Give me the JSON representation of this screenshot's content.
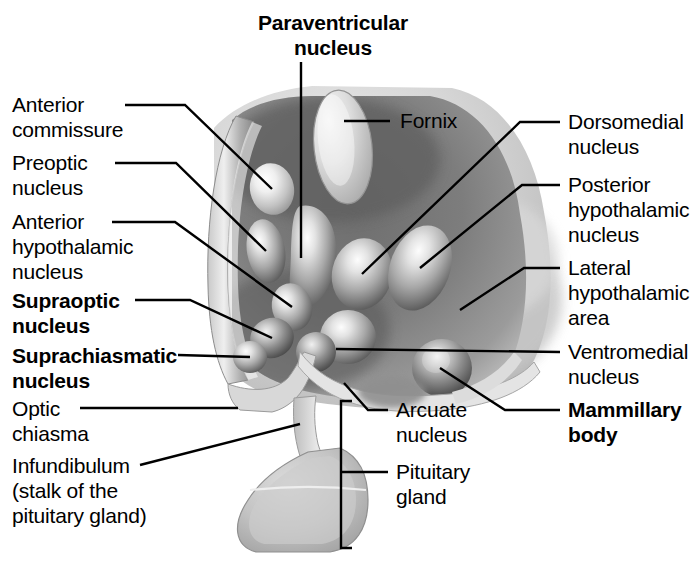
{
  "figure": {
    "background_color": "#ffffff",
    "line_color": "#000000",
    "text_color": "#000000"
  },
  "labels": {
    "paraventricular_nucleus": "Paraventricular\nnucleus",
    "anterior_commissure": "Anterior\ncommissure",
    "preoptic_nucleus": "Preoptic\nnucleus",
    "anterior_hypothalamic_nucleus": "Anterior\nhypothalamic\nnucleus",
    "supraoptic_nucleus": "Supraoptic\nnucleus",
    "suprachiasmatic_nucleus": "Suprachiasmatic\nnucleus",
    "optic_chiasma": "Optic\nchiasma",
    "infundibulum": "Infundibulum\n(stalk of the\npituitary gland)",
    "fornix": "Fornix",
    "dorsomedial_nucleus": "Dorsomedial\nnucleus",
    "posterior_hypothalamic_nucleus": "Posterior\nhypothalamic\nnucleus",
    "lateral_hypothalamic_area": "Lateral\nhypothalamic\narea",
    "ventromedial_nucleus": "Ventromedial\nnucleus",
    "mammillary_body": "Mammillary\nbody",
    "arcuate_nucleus": "Arcuate\nnucleus",
    "pituitary_gland": "Pituitary\ngland"
  },
  "label_styles": {
    "paraventricular_nucleus": "bold",
    "anterior_commissure": "regular",
    "preoptic_nucleus": "regular",
    "anterior_hypothalamic_nucleus": "regular",
    "supraoptic_nucleus": "bold",
    "suprachiasmatic_nucleus": "bold",
    "optic_chiasma": "regular",
    "infundibulum": "regular",
    "fornix": "regular",
    "dorsomedial_nucleus": "regular",
    "posterior_hypothalamic_nucleus": "regular",
    "lateral_hypothalamic_area": "regular",
    "ventromedial_nucleus": "regular",
    "mammillary_body": "bold",
    "arcuate_nucleus": "regular",
    "pituitary_gland": "regular"
  }
}
